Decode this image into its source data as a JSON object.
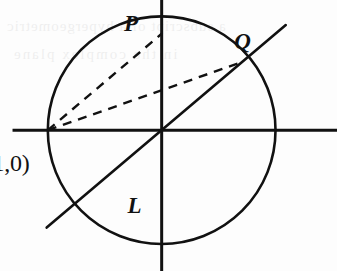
{
  "figure": {
    "background_color": "#fdfdfd",
    "stroke_color": "#111111",
    "width": 337,
    "height": 271
  },
  "labels": {
    "point_P": "P",
    "point_Q": "Q",
    "line_L": "L",
    "point_minus_one": "(-1,0)"
  },
  "artifacts": {
    "bleed_line_1": "a subscript of a hypergeometric",
    "bleed_line_2": "in the complex plane"
  },
  "chart_data": {
    "type": "scatter",
    "xlabel": "",
    "ylabel": "",
    "xlim": [
      -1.42,
      1.54
    ],
    "ylim": [
      -1.46,
      1.35
    ],
    "grid": false,
    "legend": null,
    "geometry": {
      "circle": {
        "center": [
          0,
          0
        ],
        "radius": 1,
        "style": "solid",
        "stroke_width": 2.6
      },
      "axes": {
        "x_axis": {
          "from": [
            -1.31,
            0
          ],
          "to": [
            1.54,
            0
          ],
          "style": "solid",
          "stroke_width": 3.0
        },
        "y_axis": {
          "from": [
            0,
            1.35
          ],
          "to": [
            0,
            -1.46
          ],
          "style": "solid",
          "stroke_width": 3.0
        }
      },
      "points": [
        {
          "name": "P",
          "coords": [
            0,
            1
          ],
          "label": "P",
          "label_offset": [
            -0.33,
            0.23
          ]
        },
        {
          "name": "Q",
          "coords": [
            0.707,
            0.707
          ],
          "label": "Q",
          "label_offset": [
            -0.07,
            0.33
          ]
        },
        {
          "name": "(-1,0)",
          "coords": [
            -1,
            0
          ],
          "label": "(-1,0)",
          "label_offset": [
            -0.62,
            -0.22
          ]
        }
      ],
      "lines": [
        {
          "name": "L",
          "label": "L",
          "style": "solid",
          "stroke_width": 2.6,
          "slope": 1,
          "intercept": 0,
          "from": [
            -1.01,
            -1.01
          ],
          "to": [
            1.09,
            1.09
          ],
          "label_coords": [
            -0.3,
            -0.66
          ]
        },
        {
          "name": "chord-to-P",
          "style": "dashed",
          "stroke_width": 2.4,
          "from": [
            -1,
            0
          ],
          "to": [
            0,
            1
          ],
          "dash_pattern": "9 7"
        },
        {
          "name": "chord-to-Q",
          "style": "dashed",
          "stroke_width": 2.4,
          "from": [
            -1,
            0
          ],
          "to": [
            0.707,
            0.707
          ],
          "dash_pattern": "9 7"
        }
      ]
    }
  }
}
